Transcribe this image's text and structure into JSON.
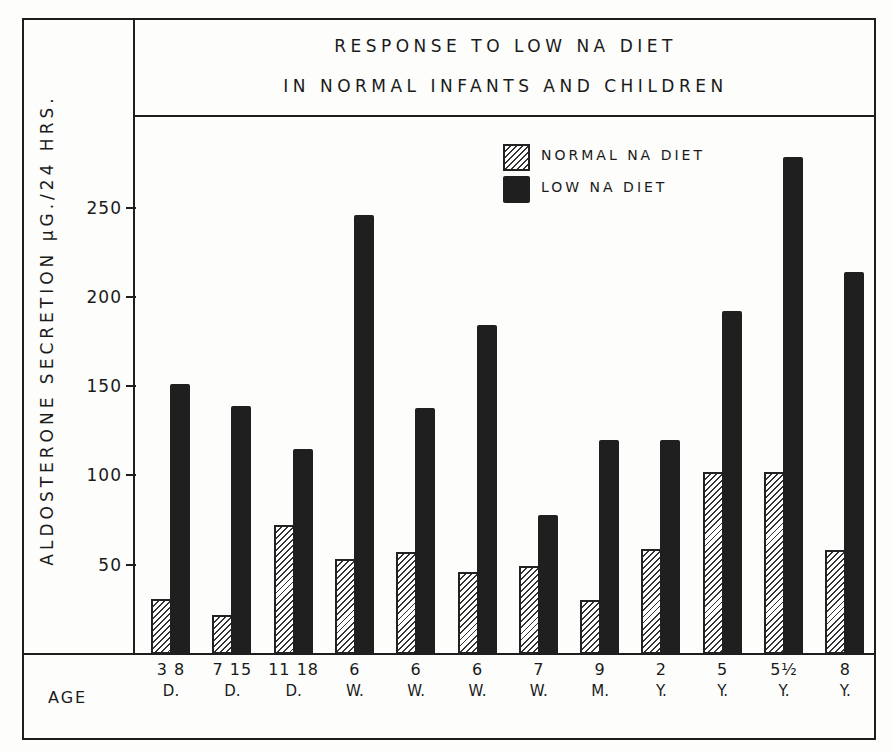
{
  "chart_data": {
    "type": "bar",
    "title_lines": [
      "RESPONSE TO LOW NA DIET",
      "IN NORMAL INFANTS AND CHILDREN"
    ],
    "xlabel": "AGE",
    "ylabel": "ALDOSTERONE SECRETION μG./24 HRS.",
    "ylim": [
      0,
      300
    ],
    "yticks": [
      50,
      100,
      150,
      200,
      250
    ],
    "grid": false,
    "legend_position": "upper-right",
    "categories": [
      {
        "num": "3 8",
        "unit": "D."
      },
      {
        "num": "7 15",
        "unit": "D."
      },
      {
        "num": "11 18",
        "unit": "D."
      },
      {
        "num": "6",
        "unit": "W."
      },
      {
        "num": "6",
        "unit": "W."
      },
      {
        "num": "6",
        "unit": "W."
      },
      {
        "num": "7",
        "unit": "W."
      },
      {
        "num": "9",
        "unit": "M."
      },
      {
        "num": "2",
        "unit": "Y."
      },
      {
        "num": "5",
        "unit": "Y."
      },
      {
        "num": "5½",
        "unit": "Y."
      },
      {
        "num": "8",
        "unit": "Y."
      }
    ],
    "series": [
      {
        "name": "NORMAL NA DIET",
        "pattern": "hatched",
        "values": [
          31,
          22,
          72,
          53,
          57,
          46,
          49,
          30,
          59,
          102,
          102,
          58
        ]
      },
      {
        "name": "LOW NA DIET",
        "pattern": "solid",
        "values": [
          151,
          139,
          115,
          246,
          138,
          184,
          78,
          120,
          120,
          192,
          278,
          214
        ]
      }
    ]
  },
  "labels": {
    "title_line_1": "RESPONSE TO LOW NA DIET",
    "title_line_2": "IN NORMAL INFANTS AND CHILDREN",
    "y_axis": "ALDOSTERONE SECRETION μG./24 HRS.",
    "x_axis": "AGE",
    "legend_normal": "NORMAL NA DIET",
    "legend_low": "LOW NA DIET"
  },
  "colors": {
    "ink": "#1e1e1e",
    "solid_bar": "#1f1f1f",
    "paper": "#fdfdfc"
  }
}
